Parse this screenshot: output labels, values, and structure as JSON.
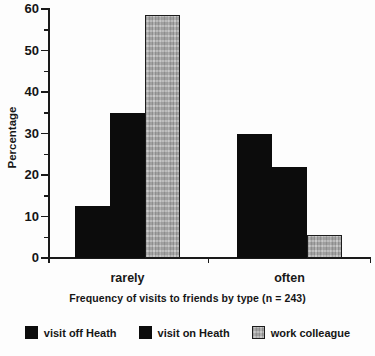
{
  "page": {
    "background": "#fdfdfd",
    "ink_color": "#121212"
  },
  "chart_data": {
    "type": "bar",
    "title": "",
    "caption": "Frequency of visits to friends by type (n = 243)",
    "xlabel": "",
    "ylabel": "Percentage",
    "categories": [
      "rarely",
      "often"
    ],
    "series": [
      {
        "name": "visit off Heath",
        "color": "#0c0c0c",
        "texture": "solid",
        "values": [
          12.5,
          30
        ]
      },
      {
        "name": "visit on Heath",
        "color": "#0c0c0c",
        "texture": "solid",
        "values": [
          35,
          22
        ]
      },
      {
        "name": "work colleague",
        "color": "#b5b5b5",
        "texture": "speckle",
        "values": [
          58.5,
          5.5
        ]
      }
    ],
    "ylim": [
      0,
      60
    ],
    "yticks": [
      0,
      10,
      20,
      30,
      40,
      50,
      60
    ],
    "minor_tick_step": 5,
    "grid": false,
    "legend_position": "bottom"
  }
}
